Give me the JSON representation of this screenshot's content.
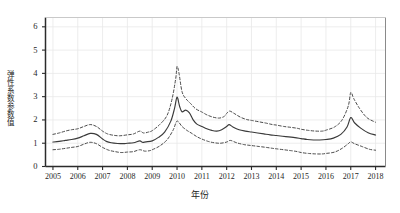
{
  "chart_data": {
    "type": "line",
    "title": "",
    "xlabel": "年份",
    "ylabel": "弹性系数参数值",
    "x": [
      2005,
      2006,
      2007,
      2008,
      2009,
      2010,
      2011,
      2012,
      2013,
      2014,
      2015,
      2016,
      2017,
      2018
    ],
    "xlim": [
      2004.7,
      2018.4
    ],
    "ylim": [
      0,
      6.4
    ],
    "yticks": [
      0,
      1,
      2,
      3,
      4,
      5,
      6
    ],
    "ytick_labels": [
      "0",
      "1",
      "2",
      "3",
      "4",
      "5",
      "6"
    ],
    "xtick_labels": [
      "2005",
      "2006",
      "2007",
      "2008",
      "2009",
      "2010",
      "2011",
      "2012",
      "2013",
      "2014",
      "2015",
      "2016",
      "2017",
      "2018"
    ],
    "grid": true,
    "legend": "none",
    "series": [
      {
        "name": "弹性系数估计值",
        "style": "solid",
        "color": "#3a3a3a",
        "values": [
          1.05,
          1.2,
          1.42,
          1.05,
          1.0,
          3.0,
          1.6,
          1.4,
          1.32,
          1.25,
          1.12,
          1.18,
          2.1,
          1.35
        ],
        "dense_x": [
          2005.0,
          2005.25,
          2005.5,
          2005.75,
          2006.0,
          2006.25,
          2006.5,
          2006.75,
          2007.0,
          2007.15,
          2007.35,
          2007.6,
          2007.85,
          2008.0,
          2008.25,
          2008.5,
          2008.6,
          2008.75,
          2009.0,
          2009.25,
          2009.5,
          2009.75,
          2009.9,
          2010.0,
          2010.1,
          2010.2,
          2010.35,
          2010.5,
          2010.65,
          2010.8,
          2011.0,
          2011.2,
          2011.4,
          2011.6,
          2011.8,
          2012.0,
          2012.1,
          2012.25,
          2012.5,
          2012.75,
          2013.0,
          2013.25,
          2013.5,
          2013.75,
          2014.0,
          2014.25,
          2014.5,
          2014.75,
          2015.0,
          2015.25,
          2015.5,
          2015.75,
          2016.0,
          2016.3,
          2016.6,
          2016.85,
          2017.0,
          2017.15,
          2017.4,
          2017.7,
          2018.0
        ],
        "dense_y": [
          1.05,
          1.08,
          1.12,
          1.16,
          1.22,
          1.32,
          1.42,
          1.38,
          1.18,
          1.08,
          1.02,
          0.99,
          0.98,
          1.0,
          1.02,
          1.1,
          1.04,
          1.06,
          1.1,
          1.25,
          1.48,
          1.95,
          2.5,
          2.98,
          2.6,
          2.35,
          2.42,
          2.3,
          2.0,
          1.82,
          1.72,
          1.62,
          1.55,
          1.52,
          1.58,
          1.72,
          1.8,
          1.7,
          1.58,
          1.52,
          1.48,
          1.44,
          1.4,
          1.36,
          1.33,
          1.3,
          1.27,
          1.24,
          1.2,
          1.16,
          1.14,
          1.14,
          1.16,
          1.22,
          1.38,
          1.7,
          2.1,
          1.88,
          1.65,
          1.45,
          1.35
        ]
      },
      {
        "name": "95%置信区间上限",
        "style": "dashed",
        "color": "#4a4a4a",
        "values": [
          1.38,
          1.55,
          1.78,
          1.42,
          1.38,
          4.3,
          2.25,
          2.0,
          1.85,
          1.72,
          1.55,
          1.62,
          3.2,
          1.9
        ],
        "dense_x": [
          2005.0,
          2005.25,
          2005.5,
          2005.75,
          2006.0,
          2006.25,
          2006.5,
          2006.75,
          2007.0,
          2007.2,
          2007.45,
          2007.7,
          2008.0,
          2008.25,
          2008.5,
          2008.65,
          2008.85,
          2009.0,
          2009.3,
          2009.6,
          2009.8,
          2009.95,
          2010.0,
          2010.08,
          2010.2,
          2010.35,
          2010.55,
          2010.75,
          2011.0,
          2011.2,
          2011.45,
          2011.7,
          2011.9,
          2012.0,
          2012.12,
          2012.3,
          2012.55,
          2012.8,
          2013.0,
          2013.3,
          2013.6,
          2013.85,
          2014.0,
          2014.3,
          2014.6,
          2014.85,
          2015.0,
          2015.3,
          2015.6,
          2015.85,
          2016.0,
          2016.35,
          2016.65,
          2016.9,
          2017.0,
          2017.12,
          2017.35,
          2017.65,
          2018.0
        ],
        "dense_y": [
          1.38,
          1.44,
          1.52,
          1.58,
          1.62,
          1.72,
          1.8,
          1.72,
          1.52,
          1.4,
          1.34,
          1.32,
          1.36,
          1.4,
          1.52,
          1.44,
          1.48,
          1.54,
          1.8,
          2.2,
          2.9,
          3.8,
          4.3,
          4.0,
          3.22,
          2.92,
          2.7,
          2.48,
          2.34,
          2.22,
          2.12,
          2.08,
          2.15,
          2.28,
          2.38,
          2.28,
          2.12,
          2.02,
          1.98,
          1.92,
          1.86,
          1.8,
          1.78,
          1.72,
          1.68,
          1.64,
          1.6,
          1.55,
          1.52,
          1.52,
          1.56,
          1.7,
          2.0,
          2.6,
          3.18,
          2.92,
          2.5,
          2.1,
          1.9
        ]
      },
      {
        "name": "95%置信区间下限",
        "style": "dashed",
        "color": "#4a4a4a",
        "values": [
          0.72,
          0.85,
          1.05,
          0.62,
          0.58,
          1.95,
          1.05,
          0.9,
          0.82,
          0.72,
          0.58,
          0.55,
          1.05,
          0.7
        ],
        "dense_x": [
          2005.0,
          2005.25,
          2005.5,
          2005.75,
          2006.0,
          2006.25,
          2006.5,
          2006.75,
          2007.0,
          2007.25,
          2007.5,
          2007.75,
          2008.0,
          2008.25,
          2008.5,
          2008.7,
          2008.9,
          2009.0,
          2009.3,
          2009.6,
          2009.85,
          2010.0,
          2010.2,
          2010.4,
          2010.6,
          2010.8,
          2011.0,
          2011.25,
          2011.5,
          2011.75,
          2012.0,
          2012.15,
          2012.4,
          2012.7,
          2013.0,
          2013.3,
          2013.6,
          2013.85,
          2014.0,
          2014.3,
          2014.6,
          2014.85,
          2015.0,
          2015.3,
          2015.6,
          2015.85,
          2016.0,
          2016.35,
          2016.65,
          2016.9,
          2017.0,
          2017.15,
          2017.45,
          2017.75,
          2018.0
        ],
        "dense_y": [
          0.72,
          0.74,
          0.78,
          0.82,
          0.86,
          0.96,
          1.04,
          0.98,
          0.82,
          0.7,
          0.64,
          0.6,
          0.62,
          0.64,
          0.72,
          0.66,
          0.68,
          0.72,
          0.88,
          1.15,
          1.58,
          1.95,
          1.72,
          1.55,
          1.42,
          1.28,
          1.18,
          1.08,
          1.02,
          1.0,
          1.05,
          1.12,
          1.02,
          0.94,
          0.9,
          0.86,
          0.82,
          0.78,
          0.76,
          0.72,
          0.68,
          0.64,
          0.6,
          0.56,
          0.54,
          0.54,
          0.56,
          0.62,
          0.78,
          0.98,
          1.06,
          0.98,
          0.86,
          0.74,
          0.7
        ]
      }
    ]
  },
  "axis": {
    "ylabel": "弹性系数参数值",
    "xlabel": "年份"
  }
}
